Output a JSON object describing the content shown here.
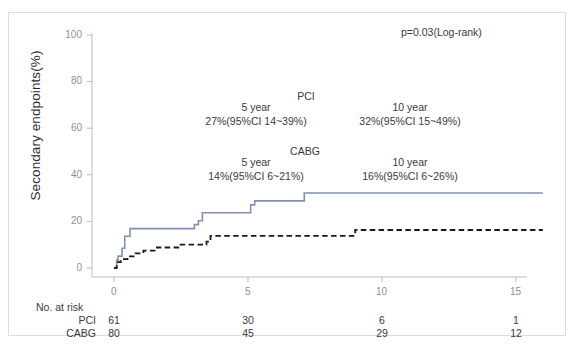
{
  "figure": {
    "type": "kaplan-meier-survival-chart",
    "background": "#ffffff",
    "frame_color": "#dcdde0"
  },
  "chart_data": {
    "type": "line",
    "title": "",
    "subtitle": "",
    "xlabel": "",
    "ylabel": "Secondary endpoints(%)",
    "xlim": [
      -0.8,
      16.2
    ],
    "ylim": [
      -4,
      104
    ],
    "xticks": [
      0,
      5,
      10,
      15
    ],
    "xticklabels": [
      "0",
      "5",
      "10",
      "15"
    ],
    "yticks": [
      0,
      20,
      40,
      60,
      80,
      100
    ],
    "yticklabels": [
      "0",
      "20",
      "40",
      "60",
      "80",
      "100"
    ],
    "grid": false,
    "legend": "none",
    "annotations": {
      "pvalue": "p=0.03(Log-rank)",
      "pci_label": "PCI",
      "cabg_label": "CABG",
      "pci_5year_title": "5 year",
      "pci_5year_value": "27%(95%CI 14~39%)",
      "pci_10year_title": "10 year",
      "pci_10year_value": "32%(95%CI 15~49%)",
      "cabg_5year_title": "5 year",
      "cabg_5year_value": "14%(95%CI 6~21%)",
      "cabg_10year_title": "10 year",
      "cabg_10year_value": "16%(95%CI 6~26%)"
    },
    "series": [
      {
        "name": "PCI",
        "style": "solid",
        "color": "#7f90b4",
        "width": 1.6,
        "points": [
          [
            0.0,
            0.0
          ],
          [
            0.1,
            3.4
          ],
          [
            0.15,
            5.1
          ],
          [
            0.3,
            8.5
          ],
          [
            0.4,
            13.6
          ],
          [
            0.6,
            16.9
          ],
          [
            2.9,
            16.9
          ],
          [
            3.0,
            18.6
          ],
          [
            3.15,
            20.3
          ],
          [
            3.3,
            23.7
          ],
          [
            5.0,
            23.7
          ],
          [
            5.1,
            27.1
          ],
          [
            5.25,
            28.8
          ],
          [
            7.0,
            28.8
          ],
          [
            7.1,
            32.2
          ],
          [
            16.0,
            32.2
          ]
        ]
      },
      {
        "name": "CABG",
        "style": "dashed",
        "color": "#1a1a1a",
        "width": 1.8,
        "points": [
          [
            0.0,
            0.0
          ],
          [
            0.1,
            2.5
          ],
          [
            0.25,
            3.8
          ],
          [
            0.5,
            5.0
          ],
          [
            0.8,
            6.3
          ],
          [
            1.1,
            7.5
          ],
          [
            1.6,
            8.8
          ],
          [
            2.3,
            8.8
          ],
          [
            2.4,
            10.0
          ],
          [
            3.3,
            10.0
          ],
          [
            3.45,
            11.3
          ],
          [
            3.6,
            13.8
          ],
          [
            8.9,
            13.8
          ],
          [
            9.0,
            16.3
          ],
          [
            16.0,
            16.3
          ]
        ]
      }
    ]
  },
  "risk_table": {
    "title": "No. at risk",
    "rows": [
      {
        "label": "PCI",
        "values": [
          "61",
          "30",
          "6",
          "1"
        ]
      },
      {
        "label": "CABG",
        "values": [
          "80",
          "45",
          "29",
          "12"
        ]
      }
    ],
    "time_points": [
      0,
      5,
      10,
      15
    ]
  }
}
